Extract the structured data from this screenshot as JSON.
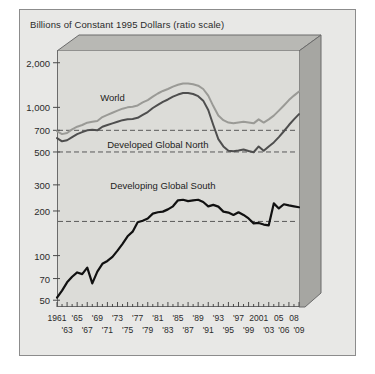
{
  "figure": {
    "title": "Billions of Constant 1995 Dollars (ratio scale)",
    "background_color": "#e8e8e6",
    "plot_color": "#dcdcd8",
    "border_color": "#8c8c8c"
  },
  "chart_data": {
    "type": "line",
    "title": "Billions of Constant 1995 Dollars (ratio scale)",
    "xlabel": "",
    "ylabel": "Billions of Constant 1995 Dollars (ratio scale)",
    "yscale": "log",
    "ylim": [
      45,
      2400
    ],
    "xlim": [
      1961,
      2009
    ],
    "grid": false,
    "legend": "inline-annotations",
    "y_ticks": [
      2000,
      1000,
      700,
      500,
      300,
      200,
      100,
      70,
      50
    ],
    "y_tick_labels": [
      "2,000",
      "1,000",
      "700",
      "500",
      "300",
      "200",
      "100",
      "70",
      "50"
    ],
    "x_ticks_top": [
      "1961",
      "'65",
      "'69",
      "'73",
      "'77",
      "'81",
      "'85",
      "'89",
      "'93",
      "'97",
      "2001",
      "05",
      "08"
    ],
    "x_ticks_bottom": [
      "'63",
      "'67",
      "'71",
      "'75",
      "'79",
      "'83",
      "'87",
      "'91",
      "'95",
      "'99",
      "'03",
      "'06",
      "'09"
    ],
    "x_values_top": [
      1961,
      1965,
      1969,
      1973,
      1977,
      1981,
      1985,
      1989,
      1993,
      1997,
      2001,
      2005,
      2008
    ],
    "x_values_bottom": [
      1963,
      1967,
      1971,
      1975,
      1979,
      1983,
      1987,
      1991,
      1995,
      1999,
      2003,
      2006,
      2009
    ],
    "reference_lines": [
      {
        "value": 700,
        "style": "dashed",
        "color": "#5a5a5a"
      },
      {
        "value": 500,
        "style": "dashed",
        "color": "#5a5a5a"
      },
      {
        "value": 170,
        "style": "dashed",
        "color": "#5a5a5a"
      }
    ],
    "annotations": [
      {
        "text": "World",
        "x": 1972,
        "y": 1150
      },
      {
        "text": "Developed Global North",
        "x": 1981,
        "y": 560
      },
      {
        "text": "Developing Global South",
        "x": 1982,
        "y": 295
      }
    ],
    "x": [
      1961,
      1962,
      1963,
      1964,
      1965,
      1966,
      1967,
      1968,
      1969,
      1970,
      1971,
      1972,
      1973,
      1974,
      1975,
      1976,
      1977,
      1978,
      1979,
      1980,
      1981,
      1982,
      1983,
      1984,
      1985,
      1986,
      1987,
      1988,
      1989,
      1990,
      1991,
      1992,
      1993,
      1994,
      1995,
      1996,
      1997,
      1998,
      1999,
      2000,
      2001,
      2002,
      2003,
      2004,
      2005,
      2006,
      2007,
      2008,
      2009
    ],
    "series": [
      {
        "name": "World",
        "color": "#9a9a96",
        "values": [
          690,
          660,
          672,
          710,
          740,
          760,
          788,
          800,
          810,
          860,
          890,
          920,
          950,
          980,
          1000,
          1010,
          1030,
          1080,
          1120,
          1180,
          1240,
          1290,
          1330,
          1380,
          1420,
          1450,
          1450,
          1430,
          1400,
          1330,
          1200,
          1020,
          880,
          820,
          790,
          780,
          790,
          800,
          790,
          780,
          830,
          790,
          830,
          880,
          950,
          1030,
          1120,
          1200,
          1280
        ]
      },
      {
        "name": "Developed Global North",
        "color": "#4e4e4e",
        "values": [
          620,
          590,
          600,
          630,
          660,
          680,
          700,
          706,
          700,
          740,
          760,
          780,
          800,
          820,
          830,
          835,
          850,
          890,
          930,
          990,
          1040,
          1090,
          1130,
          1180,
          1220,
          1250,
          1250,
          1230,
          1190,
          1110,
          960,
          760,
          610,
          545,
          510,
          505,
          512,
          520,
          508,
          498,
          545,
          510,
          545,
          580,
          630,
          690,
          760,
          830,
          900
        ]
      },
      {
        "name": "Developing Global South",
        "color": "#111111",
        "values": [
          52,
          58,
          66,
          72,
          77,
          75,
          83,
          65,
          78,
          88,
          92,
          98,
          108,
          120,
          135,
          145,
          168,
          172,
          178,
          192,
          196,
          198,
          205,
          215,
          236,
          238,
          233,
          236,
          238,
          230,
          215,
          220,
          214,
          198,
          195,
          188,
          196,
          188,
          178,
          165,
          166,
          162,
          160,
          225,
          208,
          222,
          218,
          215,
          212
        ]
      }
    ]
  }
}
